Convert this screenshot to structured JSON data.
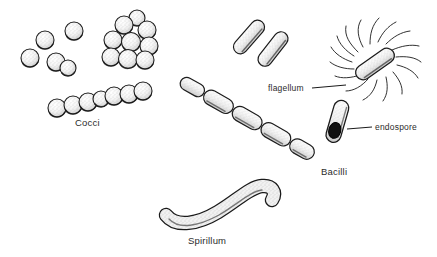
{
  "figure": {
    "title_visible": false,
    "background_color": "#ffffff",
    "ink_color": "#1a1a1a",
    "fill_color": "#f2f2f2",
    "width": 437,
    "height": 257
  },
  "labels": {
    "cocci": "Cocci",
    "bacilli": "Bacilli",
    "spirillum": "Spirillum",
    "flagellum": "flagellum",
    "endospore": "endospore"
  },
  "diagram_data": {
    "type": "scientific-illustration",
    "subject": "bacterial cell shapes and arrangements",
    "groups": [
      {
        "name": "cocci",
        "label": "Cocci",
        "label_x": 95,
        "label_y": 123,
        "description": "spherical bacteria shown singly, in a grape-like cluster, and in a chain",
        "arrangements": [
          {
            "name": "single-cocci",
            "count": 5,
            "cells": [
              {
                "cx": 30,
                "cy": 58,
                "r": 9
              },
              {
                "cx": 45,
                "cy": 40,
                "r": 9
              },
              {
                "cx": 56,
                "cy": 62,
                "r": 9
              },
              {
                "cx": 68,
                "cy": 68,
                "r": 8
              },
              {
                "cx": 74,
                "cy": 31,
                "r": 9
              }
            ]
          },
          {
            "name": "cluster-cocci",
            "count": 9,
            "cells": [
              {
                "cx": 124,
                "cy": 25,
                "r": 9
              },
              {
                "cx": 140,
                "cy": 29,
                "r": 9
              },
              {
                "cx": 113,
                "cy": 39,
                "r": 9
              },
              {
                "cx": 130,
                "cy": 42,
                "r": 9
              },
              {
                "cx": 147,
                "cy": 44,
                "r": 9
              },
              {
                "cx": 110,
                "cy": 56,
                "r": 9
              },
              {
                "cx": 127,
                "cy": 58,
                "r": 9
              },
              {
                "cx": 144,
                "cy": 59,
                "r": 9
              },
              {
                "cx": 137,
                "cy": 18,
                "r": 8
              }
            ]
          },
          {
            "name": "chain-cocci",
            "count": 8,
            "cells": [
              {
                "cx": 57,
                "cy": 108,
                "r": 9
              },
              {
                "cx": 73,
                "cy": 105,
                "r": 9
              },
              {
                "cx": 88,
                "cy": 102,
                "r": 9
              },
              {
                "cx": 101,
                "cy": 99,
                "r": 8
              },
              {
                "cx": 114,
                "cy": 96,
                "r": 9
              },
              {
                "cx": 128,
                "cy": 94,
                "r": 9
              },
              {
                "cx": 142,
                "cy": 92,
                "r": 9
              }
            ]
          }
        ]
      },
      {
        "name": "bacilli",
        "label": "Bacilli",
        "label_x": 338,
        "label_y": 172,
        "description": "rod-shaped bacteria shown singly, in a chain, with flagella, and containing an endospore",
        "arrangements": [
          {
            "name": "single-rods",
            "count": 2,
            "cells": [
              {
                "x1": 236,
                "y1": 52,
                "x2": 262,
                "y2": 22,
                "w": 13
              },
              {
                "x1": 262,
                "y1": 64,
                "x2": 285,
                "y2": 34,
                "w": 13
              }
            ]
          },
          {
            "name": "chain-rods",
            "count": 5,
            "cells": [
              {
                "x1": 186,
                "y1": 84,
                "x2": 208,
                "y2": 95,
                "w": 12
              },
              {
                "x1": 208,
                "y1": 95,
                "x2": 234,
                "y2": 109,
                "w": 14
              },
              {
                "x1": 234,
                "y1": 109,
                "x2": 260,
                "y2": 124,
                "w": 14
              },
              {
                "x1": 260,
                "y1": 124,
                "x2": 286,
                "y2": 139,
                "w": 14
              },
              {
                "x1": 286,
                "y1": 139,
                "x2": 303,
                "y2": 150,
                "w": 13
              }
            ]
          },
          {
            "name": "flagellated-rod",
            "count": 1,
            "flagella_count": 16,
            "cells": [
              {
                "cx": 375,
                "cy": 64,
                "length": 44,
                "w": 15,
                "angle_deg": -35
              }
            ]
          },
          {
            "name": "endospore-rod",
            "count": 1,
            "cells": [
              {
                "x1": 333,
                "y1": 101,
                "x2": 344,
                "y2": 141,
                "w": 14
              }
            ],
            "endospore": {
              "cx": 342,
              "cy": 130,
              "rx": 5.5,
              "ry": 7,
              "color": "#111111"
            }
          }
        ],
        "callouts": [
          {
            "name": "flagellum",
            "label": "flagellum",
            "text_x": 270,
            "text_y": 88,
            "line_x1": 312,
            "line_y1": 88,
            "line_x2": 345,
            "line_y2": 85
          },
          {
            "name": "endospore",
            "label": "endospore",
            "text_x": 375,
            "text_y": 127,
            "line_x1": 372,
            "line_y1": 127,
            "line_x2": 347,
            "line_y2": 129
          }
        ]
      },
      {
        "name": "spirillum",
        "label": "Spirillum",
        "label_x": 213,
        "label_y": 241,
        "description": "a single curved, spiral-shaped bacterium with an S-shaped body",
        "arrangements": [
          {
            "name": "single-spirillum",
            "count": 1,
            "path": "M 166 215 C 176 228, 196 224, 216 213 C 236 202, 248 188, 262 186 C 272 185, 276 192, 272 199"
          }
        ]
      }
    ]
  }
}
